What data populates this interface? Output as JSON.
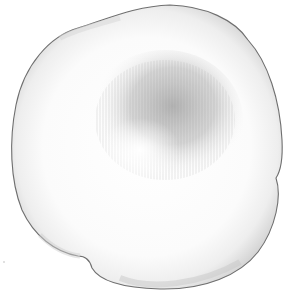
{
  "image": {
    "subject": "pencil drawing of a fungal colony",
    "description": "Roughly circular, slightly lobed colony with a pale margin and darker radially striated grey center",
    "colors": {
      "background": "#ffffff",
      "outline": "#6f6f6f",
      "margin_shade": "#d9d9d9",
      "center_shade": "#9a9a9a",
      "body": "#fbfbfb"
    }
  }
}
